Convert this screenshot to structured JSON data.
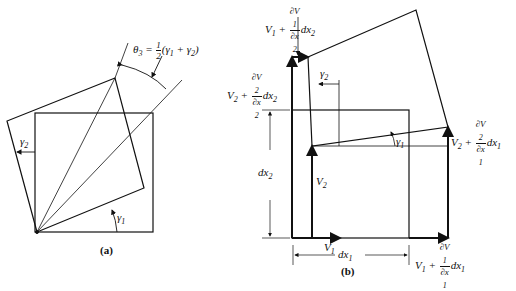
{
  "panel_a": {
    "caption": "(a)",
    "theta_label": {
      "lhs": "θ",
      "lhs_sub": "3",
      "eq": " = ",
      "frac_num": "1",
      "frac_den": "2",
      "rhs": "(γ",
      "rhs_sub1": "1",
      "plus": " + γ",
      "rhs_sub2": "2",
      "close": ")"
    },
    "gamma1": {
      "sym": "γ",
      "sub": "1"
    },
    "gamma2": {
      "sym": "γ",
      "sub": "2"
    }
  },
  "panel_b": {
    "caption": "(b)",
    "top_left": {
      "pre": "V",
      "pre_sub": "1",
      "plus": " + ",
      "num": "∂V",
      "num_sub": "1",
      "den": "∂x",
      "den_sub": "2",
      "post": "dx",
      "post_sub": "2"
    },
    "left_mid": {
      "pre": "V",
      "pre_sub": "2",
      "plus": " + ",
      "num": "∂V",
      "num_sub": "2",
      "den": "∂x",
      "den_sub": "2",
      "post": "dx",
      "post_sub": "2"
    },
    "right_mid": {
      "pre": "V",
      "pre_sub": "2",
      "plus": " + ",
      "num": "∂V",
      "num_sub": "2",
      "den": "∂x",
      "den_sub": "1",
      "post": "dx",
      "post_sub": "1"
    },
    "bottom_right": {
      "pre": "V",
      "pre_sub": "1",
      "plus": " + ",
      "num": "∂V",
      "num_sub": "1",
      "den": "∂x",
      "den_sub": "1",
      "post": "dx",
      "post_sub": "1"
    },
    "gamma1": {
      "sym": "γ",
      "sub": "1"
    },
    "gamma2": {
      "sym": "γ",
      "sub": "2"
    },
    "v1": {
      "sym": "V",
      "sub": "1"
    },
    "v2": {
      "sym": "V",
      "sub": "2"
    },
    "dx1": {
      "sym": "dx",
      "sub": "1"
    },
    "dx2": {
      "sym": "dx",
      "sub": "2"
    }
  }
}
